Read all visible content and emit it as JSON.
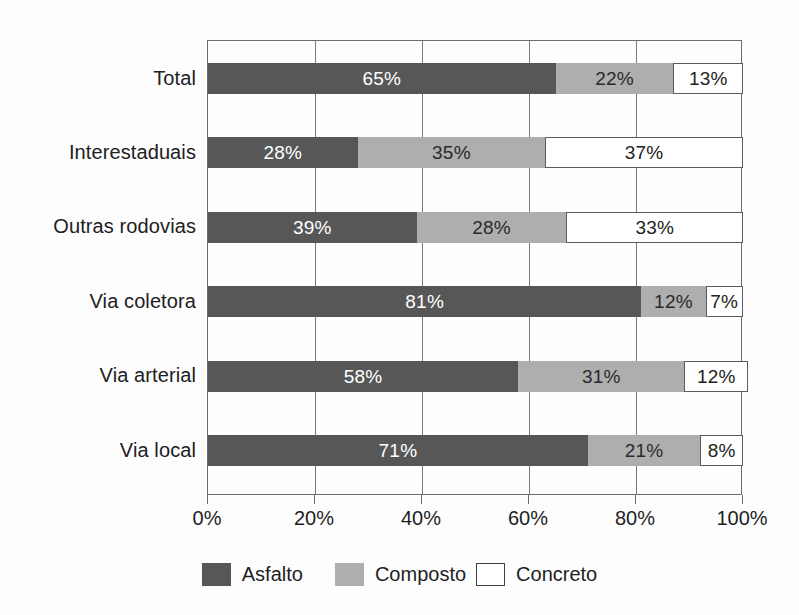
{
  "chart_data": {
    "type": "bar",
    "orientation": "horizontal",
    "stacked": true,
    "title": "",
    "subtitle": "",
    "xlabel": "",
    "ylabel": "",
    "xlim": [
      0,
      100
    ],
    "xtick_labels": [
      "0%",
      "20%",
      "40%",
      "60%",
      "80%",
      "100%"
    ],
    "xtick_values": [
      0,
      20,
      40,
      60,
      80,
      100
    ],
    "grid": true,
    "grid_axis": "x",
    "legend_position": "bottom",
    "categories": [
      "Total",
      "Interestaduais",
      "Outras rodovias",
      "Via coletora",
      "Via arterial",
      "Via local"
    ],
    "series": [
      {
        "name": "Asfalto",
        "color": "#575757",
        "values": [
          65,
          28,
          39,
          81,
          58,
          71
        ]
      },
      {
        "name": "Composto",
        "color": "#aeaeae",
        "values": [
          22,
          35,
          28,
          12,
          31,
          21
        ]
      },
      {
        "name": "Concreto",
        "color": "#ffffff",
        "values": [
          13,
          37,
          33,
          7,
          12,
          8
        ]
      }
    ],
    "data_labels": [
      [
        "65%",
        "22%",
        "13%"
      ],
      [
        "28%",
        "35%",
        "37%"
      ],
      [
        "39%",
        "28%",
        "33%"
      ],
      [
        "81%",
        "12%",
        "7%"
      ],
      [
        "58%",
        "31%",
        "12%"
      ],
      [
        "71%",
        "21%",
        "8%"
      ]
    ]
  },
  "axis": {
    "ticks": [
      {
        "label": "0%",
        "value": 0
      },
      {
        "label": "20%",
        "value": 20
      },
      {
        "label": "40%",
        "value": 40
      },
      {
        "label": "60%",
        "value": 60
      },
      {
        "label": "80%",
        "value": 80
      },
      {
        "label": "100%",
        "value": 100
      }
    ]
  },
  "legend": {
    "items": [
      {
        "label": "Asfalto",
        "swatch": "asfalto"
      },
      {
        "label": "Composto",
        "swatch": "composto"
      },
      {
        "label": "Concreto",
        "swatch": "concreto"
      }
    ]
  },
  "colors": {
    "asfalto": "#575757",
    "composto": "#aeaeae",
    "concreto": "#ffffff",
    "axis": "#6e6e6e",
    "grid": "#7a7a7a",
    "background": "#fdfdfd",
    "text": "#1f1f1f"
  }
}
